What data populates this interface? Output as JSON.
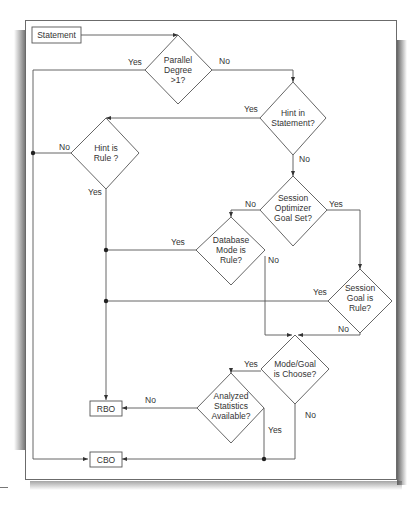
{
  "diagram": {
    "type": "flowchart",
    "nodes": {
      "statement": {
        "label": "Statement"
      },
      "parallel": {
        "lines": [
          "Parallel",
          "Degree",
          ">1?"
        ]
      },
      "hint_in_statement": {
        "lines": [
          "Hint in",
          "Statement?"
        ]
      },
      "hint_is_rule": {
        "lines": [
          "Hint is",
          "Rule ?"
        ]
      },
      "session_optimizer": {
        "lines": [
          "Session",
          "Optimizer",
          "Goal Set?"
        ]
      },
      "database_mode": {
        "lines": [
          "Database",
          "Mode is",
          "Rule?"
        ]
      },
      "session_goal": {
        "lines": [
          "Session",
          "Goal is",
          "Rule?"
        ]
      },
      "mode_goal": {
        "lines": [
          "Mode/Goal",
          "is Choose?"
        ]
      },
      "analyzed_stats": {
        "lines": [
          "Analyzed",
          "Statistics",
          "Available?"
        ]
      },
      "rbo": {
        "label": "RBO"
      },
      "cbo": {
        "label": "CBO"
      }
    },
    "edge_labels": {
      "parallel_yes": "Yes",
      "parallel_no": "No",
      "hint_statement_yes": "Yes",
      "hint_statement_no": "No",
      "hint_rule_no": "No",
      "hint_rule_yes": "Yes",
      "session_opt_no": "No",
      "session_opt_yes": "Yes",
      "db_mode_yes": "Yes",
      "db_mode_no": "No",
      "session_goal_yes": "Yes",
      "session_goal_no": "No",
      "mode_goal_yes": "Yes",
      "mode_goal_no": "No",
      "analyzed_no": "No",
      "analyzed_yes": "Yes"
    },
    "edges": [
      {
        "from": "statement",
        "to": "parallel"
      },
      {
        "from": "parallel",
        "to": "cbo",
        "label": "Yes"
      },
      {
        "from": "parallel",
        "to": "hint_in_statement",
        "label": "No"
      },
      {
        "from": "hint_in_statement",
        "to": "hint_is_rule",
        "label": "Yes"
      },
      {
        "from": "hint_in_statement",
        "to": "session_optimizer",
        "label": "No"
      },
      {
        "from": "hint_is_rule",
        "to": "cbo",
        "label": "No"
      },
      {
        "from": "hint_is_rule",
        "to": "rbo",
        "label": "Yes"
      },
      {
        "from": "session_optimizer",
        "to": "database_mode",
        "label": "No"
      },
      {
        "from": "session_optimizer",
        "to": "session_goal",
        "label": "Yes"
      },
      {
        "from": "database_mode",
        "to": "rbo",
        "label": "Yes"
      },
      {
        "from": "database_mode",
        "to": "mode_goal",
        "label": "No"
      },
      {
        "from": "session_goal",
        "to": "rbo",
        "label": "Yes"
      },
      {
        "from": "session_goal",
        "to": "mode_goal",
        "label": "No"
      },
      {
        "from": "mode_goal",
        "to": "analyzed_stats",
        "label": "Yes"
      },
      {
        "from": "mode_goal",
        "to": "cbo",
        "label": "No"
      },
      {
        "from": "analyzed_stats",
        "to": "rbo",
        "label": "No"
      },
      {
        "from": "analyzed_stats",
        "to": "cbo",
        "label": "Yes"
      }
    ]
  }
}
